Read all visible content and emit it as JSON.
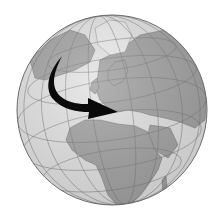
{
  "image": {
    "subject": "globe",
    "view": "Europe and Africa centered orthographic globe",
    "colors": {
      "background": "#ffffff",
      "ocean": "#e6e6e6",
      "land": "#a3a3a3",
      "ice": "#ececec",
      "gridlines": "#7a7a7a",
      "outline": "#6a6a6a",
      "arrow": "#0a0a0a"
    },
    "arrow": {
      "description": "curved black arrow from North Atlantic to Mediterranean",
      "direction": "south-east"
    }
  }
}
